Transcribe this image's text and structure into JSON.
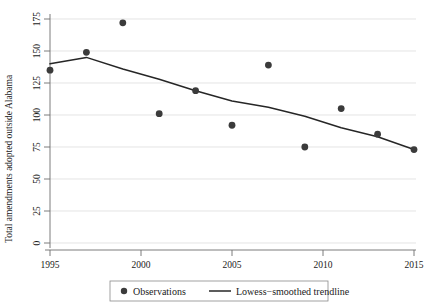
{
  "chart_data": {
    "type": "scatter",
    "title": "",
    "xlabel": "",
    "ylabel": "Total amendments adopted outside Alabama",
    "xlim": [
      1994,
      2016
    ],
    "ylim": [
      0,
      180
    ],
    "xticks": [
      1995,
      2000,
      2005,
      2010,
      2015
    ],
    "yticks": [
      0,
      25,
      50,
      75,
      100,
      125,
      150,
      175
    ],
    "grid": true,
    "legend_position": "bottom-center",
    "x": [
      1995,
      1997,
      1999,
      2001,
      2003,
      2005,
      2007,
      2009,
      2011,
      2013,
      2015
    ],
    "series": [
      {
        "name": "Observations",
        "type": "scatter",
        "marker": "circle",
        "color": "#3b3b3b",
        "values": [
          135,
          149,
          172,
          101,
          119,
          92,
          139,
          75,
          105,
          85,
          73
        ]
      },
      {
        "name": "Lowess-smoothed trendline",
        "type": "line",
        "color": "#262626",
        "x": [
          1995,
          1997,
          1999,
          2001,
          2003,
          2005,
          2007,
          2009,
          2011,
          2013,
          2015
        ],
        "values": [
          140,
          145,
          136,
          128,
          119,
          111,
          106,
          99,
          90,
          83,
          73
        ]
      }
    ],
    "annotations": []
  },
  "axes": {
    "y_title": "Total amendments adopted outside Alabama",
    "y_tick_labels": [
      "175",
      "150",
      "125",
      "100",
      "75",
      "50",
      "25",
      "0"
    ],
    "x_tick_labels": [
      "1995",
      "2000",
      "2005",
      "2010",
      "2015"
    ]
  },
  "legend": {
    "observations_label": "Observations",
    "trendline_label": "Lowess−smoothed trendline"
  }
}
